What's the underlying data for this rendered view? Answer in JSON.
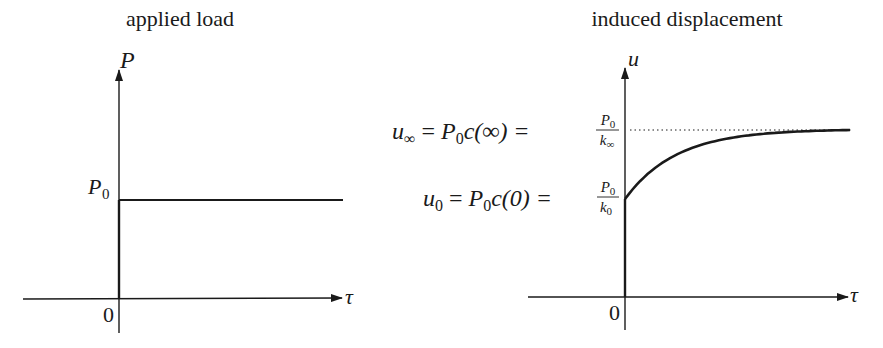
{
  "panels": [
    {
      "title": "applied load",
      "y_axis_label": "P",
      "x_axis_label": "τ",
      "origin_label": "0",
      "level_label": {
        "main": "P",
        "sub": "0"
      }
    },
    {
      "title": "induced displacement",
      "y_axis_label": "u",
      "x_axis_label": "τ",
      "origin_label": "0",
      "asymptote_label": {
        "lhs_main": "u",
        "lhs_sub": "∞",
        "middle": "= P",
        "middle_sub": "0",
        "middle_rest": "c(∞) =",
        "frac_num_main": "P",
        "frac_num_sub": "0",
        "frac_den_main": "k",
        "frac_den_sub": "∞"
      },
      "initial_label": {
        "lhs_main": "u",
        "lhs_sub": "0",
        "middle": "= P",
        "middle_sub": "0",
        "middle_rest": "c(0) =",
        "frac_num_main": "P",
        "frac_num_sub": "0",
        "frac_den_main": "k",
        "frac_den_sub": "0"
      }
    }
  ],
  "curve": {
    "initial_fraction": 0.0,
    "description": "exponential rise from u0 approaching u∞",
    "decay_constant": 2.2
  }
}
